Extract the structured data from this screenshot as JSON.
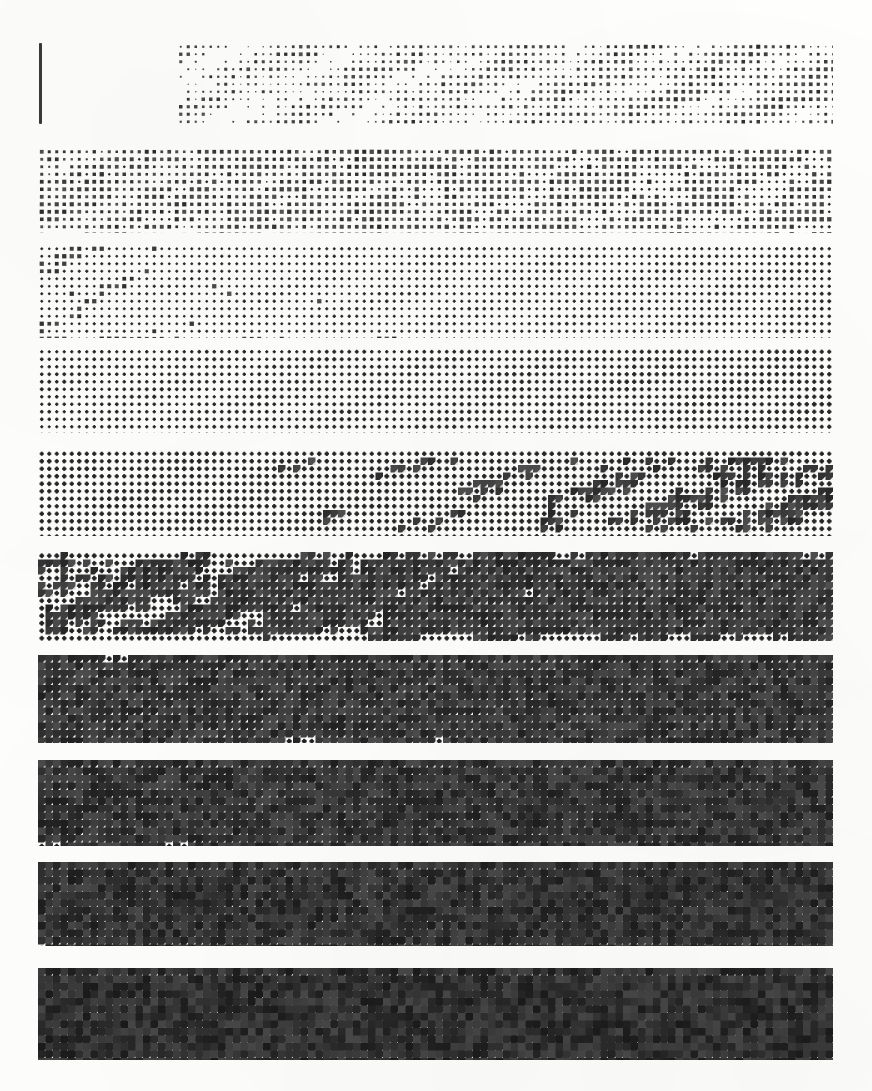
{
  "document": {
    "title": "Halftone Density Test Chart",
    "kind": "printed grayscale step wedge / dither pattern reference",
    "page_width": 872,
    "page_height": 1091,
    "background_color": "#fefefd",
    "ink_color": "#1b1b1b"
  },
  "registration_rule": {
    "label": "vertical registration rule",
    "x": 39,
    "y": 43,
    "width": 3,
    "height": 81,
    "color": "#3a3a3a"
  },
  "chart_data": {
    "type": "heatmap",
    "subtitle": "Ten horizontal halftone bands of increasing ink coverage",
    "xlabel": "",
    "ylabel": "",
    "grid": false,
    "legend": "none",
    "cell_pitch_px": 7.5,
    "dot_shape": "cross-in-square halftone cell",
    "categories": [
      "Band 1",
      "Band 2",
      "Band 3",
      "Band 4",
      "Band 5",
      "Band 6",
      "Band 7",
      "Band 8",
      "Band 9",
      "Band 10"
    ],
    "values": [
      4,
      12,
      24,
      38,
      52,
      64,
      74,
      82,
      88,
      94
    ],
    "units": "percent ink coverage",
    "ylim": [
      0,
      100
    ],
    "series": [
      {
        "name": "ink coverage (%)",
        "values": [
          4,
          12,
          24,
          38,
          52,
          64,
          74,
          82,
          88,
          94
        ]
      },
      {
        "name": "mean gray level (0-255)",
        "values": [
          245,
          224,
          194,
          158,
          122,
          92,
          68,
          48,
          34,
          22
        ]
      }
    ],
    "bands": [
      {
        "index": 1,
        "name": "Band 1",
        "coverage": 4,
        "gray": 245,
        "x": 177,
        "y": 43,
        "width": 656,
        "height": 82,
        "left_density": 0.03,
        "right_density": 0.075,
        "dot_scale": 0.22,
        "ink": "#2e2e2e",
        "note": "sparse isolated dots, partial width starting right of the rule"
      },
      {
        "index": 2,
        "name": "Band 2",
        "coverage": 12,
        "gray": 224,
        "x": 38,
        "y": 148,
        "width": 795,
        "height": 85,
        "left_density": 0.09,
        "right_density": 0.16,
        "dot_scale": 0.34,
        "ink": "#2b2b2b",
        "note": "fine even dot screen, light"
      },
      {
        "index": 3,
        "name": "Band 3",
        "coverage": 24,
        "gray": 194,
        "x": 38,
        "y": 245,
        "width": 795,
        "height": 93,
        "left_density": 0.19,
        "right_density": 0.33,
        "dot_scale": 0.46,
        "ink": "#2a2a2a",
        "note": "density steps up noticeably past midpoint"
      },
      {
        "index": 4,
        "name": "Band 4",
        "coverage": 38,
        "gray": 158,
        "x": 38,
        "y": 348,
        "width": 795,
        "height": 85,
        "left_density": 0.32,
        "right_density": 0.47,
        "dot_scale": 0.58,
        "ink": "#282828",
        "note": "cross / X shaped cells clearly resolved"
      },
      {
        "index": 5,
        "name": "Band 5",
        "coverage": 52,
        "gray": 122,
        "x": 38,
        "y": 450,
        "width": 795,
        "height": 86,
        "left_density": 0.47,
        "right_density": 0.59,
        "dot_scale": 0.7,
        "ink": "#272727",
        "note": "cells merging, white diamonds remain"
      },
      {
        "index": 6,
        "name": "Band 6",
        "coverage": 64,
        "gray": 92,
        "x": 38,
        "y": 552,
        "width": 795,
        "height": 89,
        "left_density": 0.59,
        "right_density": 0.7,
        "dot_scale": 0.8,
        "ink": "#242424",
        "note": "mid-dark continuous texture"
      },
      {
        "index": 7,
        "name": "Band 7",
        "coverage": 74,
        "gray": 68,
        "x": 38,
        "y": 655,
        "width": 795,
        "height": 88,
        "left_density": 0.7,
        "right_density": 0.79,
        "dot_scale": 0.87,
        "ink": "#222222",
        "note": "dark, fine white pinholes"
      },
      {
        "index": 8,
        "name": "Band 8",
        "coverage": 82,
        "gray": 48,
        "x": 38,
        "y": 760,
        "width": 795,
        "height": 86,
        "left_density": 0.78,
        "right_density": 0.86,
        "dot_scale": 0.92,
        "ink": "#1f1f1f",
        "note": "near solid with residual highlight grid"
      },
      {
        "index": 9,
        "name": "Band 9",
        "coverage": 88,
        "gray": 34,
        "x": 38,
        "y": 862,
        "width": 795,
        "height": 84,
        "left_density": 0.85,
        "right_density": 0.91,
        "dot_scale": 0.95,
        "ink": "#1d1d1d",
        "note": "very dark, sparse white dots"
      },
      {
        "index": 10,
        "name": "Band 10",
        "coverage": 94,
        "gray": 22,
        "x": 38,
        "y": 968,
        "width": 795,
        "height": 92,
        "left_density": 0.915,
        "right_density": 0.955,
        "dot_scale": 0.97,
        "ink": "#1b1b1b",
        "note": "darkest step, almost solid ink"
      }
    ]
  }
}
